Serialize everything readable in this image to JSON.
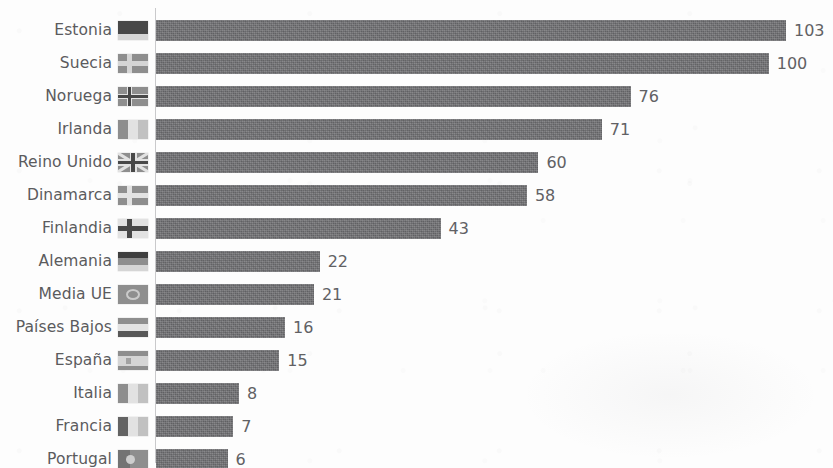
{
  "chart_data": {
    "type": "bar",
    "orientation": "horizontal",
    "title": "",
    "subtitle": "",
    "xlabel": "",
    "ylabel": "",
    "grid": false,
    "legend": false,
    "legend_position": "none",
    "value_labels_shown": true,
    "sorted": "descending",
    "xlim": [
      0,
      103
    ],
    "categories": [
      "Estonia",
      "Suecia",
      "Noruega",
      "Irlanda",
      "Reino Unido",
      "Dinamarca",
      "Finlandia",
      "Alemania",
      "Media UE",
      "Países Bajos",
      "España",
      "Italia",
      "Francia",
      "Portugal"
    ],
    "values": [
      103,
      100,
      76,
      71,
      60,
      58,
      43,
      22,
      21,
      16,
      15,
      8,
      7,
      6
    ],
    "value_labels": [
      "103",
      "100",
      "76",
      "71",
      "60",
      "58",
      "43",
      "22",
      "21",
      "16",
      "15",
      "8",
      "7",
      "6"
    ],
    "flags": [
      "flag-estonia",
      "flag-sweden",
      "flag-norway",
      "flag-ireland",
      "flag-united-kingdom",
      "flag-denmark",
      "flag-finland",
      "flag-germany",
      "flag-european-union",
      "flag-netherlands",
      "flag-spain",
      "flag-italy",
      "flag-france",
      "flag-portugal"
    ],
    "colors": {
      "bar": "#6f6f72",
      "value_label": "#616164",
      "category_label": "#5b5b5d",
      "axis_line": "#c9c9cb",
      "background": "#fdfdfd"
    }
  }
}
